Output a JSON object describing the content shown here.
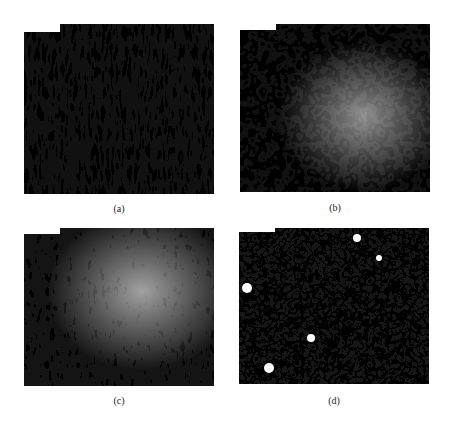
{
  "figure": {
    "panels": [
      {
        "id": "a",
        "label": "(a)",
        "pattern": "elongated-vertical-ridges",
        "x": 24,
        "y": 24,
        "w": 190,
        "h": 170,
        "notch": {
          "w": 36,
          "h": 8
        }
      },
      {
        "id": "b",
        "label": "(b)",
        "pattern": "polygonal-cellular-network",
        "x": 240,
        "y": 24,
        "w": 190,
        "h": 168,
        "notch": {
          "w": 36,
          "h": 6
        }
      },
      {
        "id": "c",
        "label": "(c)",
        "pattern": "branching-radial-ridges",
        "x": 24,
        "y": 228,
        "w": 190,
        "h": 158,
        "notch": {
          "w": 36,
          "h": 6
        }
      },
      {
        "id": "d",
        "label": "(d)",
        "pattern": "fine-cellular-network-with-voids",
        "x": 239,
        "y": 228,
        "w": 190,
        "h": 156,
        "notch": {
          "w": 36,
          "h": 4
        }
      }
    ],
    "colors": {
      "foreground": "#1a1a1a",
      "background": "#ffffff"
    }
  }
}
